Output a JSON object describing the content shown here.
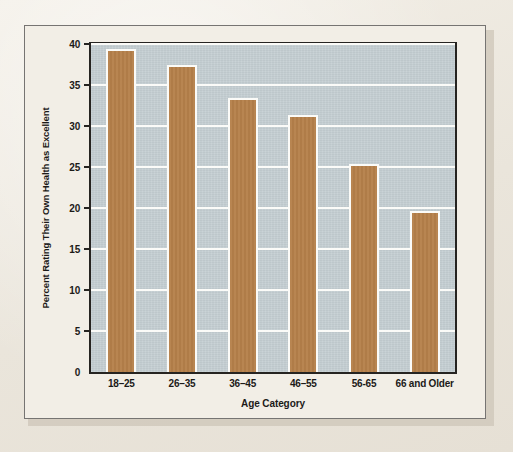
{
  "figure": {
    "frame_border_color": "#767472",
    "page_background": "#efebe2",
    "plot_background": "#c4ced2",
    "bar_color": "#b5804a",
    "bar_outline_color": "#fbfbf8",
    "gridline_color": "#fbfbf8",
    "axis_color": "#262421"
  },
  "chart_data": {
    "type": "bar",
    "title": "",
    "xlabel": "Age Category",
    "ylabel": "Percent Rating Their Own Health as Excellent",
    "categories": [
      "18–25",
      "26–35",
      "36–45",
      "46–55",
      "56-65",
      "66 and Older"
    ],
    "values": [
      39.4,
      37.4,
      33.4,
      31.4,
      25.4,
      19.6
    ],
    "ylim": [
      0,
      40
    ],
    "yticks": [
      0,
      5,
      10,
      15,
      20,
      25,
      30,
      35,
      40
    ],
    "ytick_labels": [
      "0",
      "5",
      "10",
      "15",
      "20",
      "25",
      "30",
      "35",
      "40"
    ],
    "grid": true,
    "legend": false,
    "orientation": "vertical"
  }
}
